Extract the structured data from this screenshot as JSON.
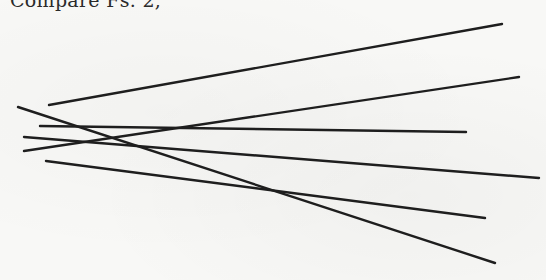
{
  "page": {
    "caption_text": "Compare Fs. 2,",
    "background_color": "#f8f8f6",
    "ink_color": "#1e1e1e"
  },
  "figure": {
    "intersection_point": [
      135,
      135
    ],
    "lines": [
      {
        "id": "line-1",
        "x1": 49,
        "y1": 105,
        "x2": 502,
        "y2": 24
      },
      {
        "id": "line-2",
        "x1": 24,
        "y1": 151,
        "x2": 519,
        "y2": 77
      },
      {
        "id": "line-3",
        "x1": 40,
        "y1": 126,
        "x2": 466,
        "y2": 132
      },
      {
        "id": "line-4",
        "x1": 24,
        "y1": 137,
        "x2": 539,
        "y2": 178
      },
      {
        "id": "line-5",
        "x1": 46,
        "y1": 161,
        "x2": 485,
        "y2": 218
      },
      {
        "id": "line-6",
        "x1": 18,
        "y1": 107,
        "x2": 495,
        "y2": 263
      }
    ]
  }
}
